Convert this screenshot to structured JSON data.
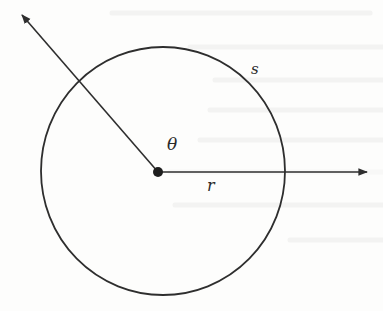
{
  "figure": {
    "colors": {
      "background": "#fdfdfc",
      "stroke": "#2e2e2e",
      "bleed_through": "#ececec"
    },
    "circle": {
      "cx": 163,
      "cy": 171,
      "rx": 122,
      "ry": 124
    },
    "center_point": {
      "x": 158,
      "y": 172,
      "r": 5
    },
    "rays": [
      {
        "name": "horizontal-ray",
        "from": [
          158,
          172
        ],
        "to": [
          367,
          172
        ]
      },
      {
        "name": "angled-ray",
        "from": [
          158,
          172
        ],
        "to": [
          22,
          15
        ]
      }
    ],
    "labels": {
      "theta": {
        "text": "θ",
        "x": 167,
        "y": 150,
        "size": 17
      },
      "r": {
        "text": "r",
        "x": 207,
        "y": 191,
        "size": 16
      },
      "s": {
        "text": "s",
        "x": 251,
        "y": 74,
        "size": 15
      }
    }
  }
}
